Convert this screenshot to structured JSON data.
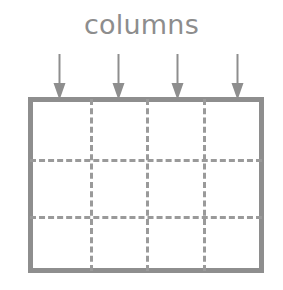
{
  "diagram": {
    "title": "columns",
    "caption_label": "columns",
    "colors": {
      "stroke": "#8e8e8e",
      "dashed_line": "#9a9a9a",
      "text": "#8d8d8d",
      "background": "#ffffff",
      "arrow": "#8e8e8e"
    },
    "table": {
      "column_count": 4,
      "row_count": 3,
      "border_style": "solid",
      "inner_line_style": "dashed",
      "cells": [
        [
          "",
          "",
          "",
          ""
        ],
        [
          "",
          "",
          "",
          ""
        ],
        [
          "",
          "",
          "",
          ""
        ]
      ]
    },
    "arrows": {
      "count": 4,
      "direction": "down",
      "points_to": "column",
      "items": [
        {
          "name": "arrow-column-1",
          "x": 52
        },
        {
          "name": "arrow-column-2",
          "x": 111
        },
        {
          "name": "arrow-column-3",
          "x": 170
        },
        {
          "name": "arrow-column-4",
          "x": 230
        }
      ]
    },
    "grid_lines": {
      "vertical_percent": [
        25,
        50,
        75
      ],
      "horizontal_percent": [
        34.5,
        68.5
      ]
    }
  }
}
